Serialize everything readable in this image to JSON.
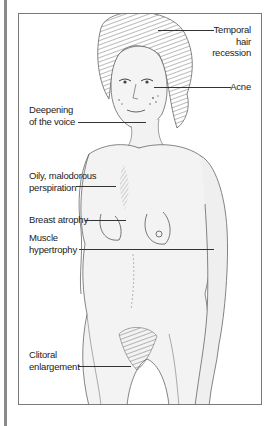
{
  "diagram": {
    "type": "labeled-medical-illustration",
    "colors": {
      "frame_border": "#7a7a7a",
      "side_bar": "#8a8a8a",
      "label_text": "#222222",
      "leader_line": "#333333",
      "sketch": "#555555"
    },
    "labels": [
      {
        "id": "temporal-hair-recession",
        "lines": [
          "Temporal",
          "hair",
          "recession"
        ],
        "side": "right"
      },
      {
        "id": "acne",
        "lines": [
          "Acne"
        ],
        "side": "right"
      },
      {
        "id": "deepening-of-the-voice",
        "lines": [
          "Deepening",
          "of the voice"
        ],
        "side": "left"
      },
      {
        "id": "oily-malodorous-perspiration",
        "lines": [
          "Oily, malodorous",
          "perspiration"
        ],
        "side": "left"
      },
      {
        "id": "breast-atrophy",
        "lines": [
          "Breast atrophy"
        ],
        "side": "left"
      },
      {
        "id": "muscle-hypertrophy",
        "lines": [
          "Muscle",
          "hypertrophy"
        ],
        "side": "left"
      },
      {
        "id": "clitoral-enlargement",
        "lines": [
          "Clitoral",
          "enlargement"
        ],
        "side": "left"
      }
    ]
  }
}
